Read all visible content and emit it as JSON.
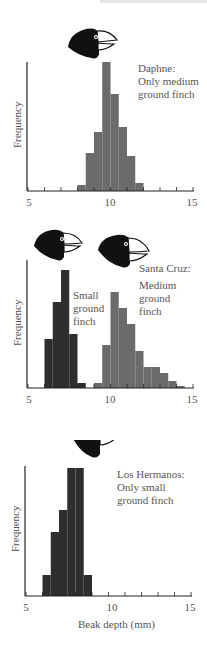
{
  "chart_data": [
    {
      "type": "bar",
      "title": "Daphne: Only medium ground finch",
      "xlabel": "",
      "ylabel": "Frequency",
      "xlim": [
        5,
        15
      ],
      "x_ticks": [
        5,
        10,
        15
      ],
      "bin_width": 0.5,
      "series": [
        {
          "name": "Medium ground finch",
          "color": "#6b6b6b",
          "bins": [
            8.0,
            8.5,
            9.0,
            9.5,
            10.0,
            10.5,
            11.0,
            11.5
          ],
          "values": [
            6,
            38,
            59,
            129,
            97,
            64,
            35,
            8
          ]
        }
      ]
    },
    {
      "type": "bar",
      "title": "Santa Cruz:",
      "xlabel": "",
      "ylabel": "Frequency",
      "xlim": [
        5,
        15
      ],
      "x_ticks": [
        5,
        10,
        15
      ],
      "bin_width": 0.5,
      "series": [
        {
          "name": "Small ground finch",
          "color": "#2e2e2e",
          "bins": [
            6.0,
            6.5,
            7.0,
            7.5,
            8.0
          ],
          "values": [
            49,
            86,
            118,
            54,
            5
          ]
        },
        {
          "name": "Medium ground finch",
          "color": "#6b6b6b",
          "bins": [
            9.0,
            9.5,
            10.0,
            10.5,
            11.0,
            11.5,
            12.0,
            12.5,
            13.0,
            13.5,
            14.0
          ],
          "values": [
            5,
            43,
            96,
            80,
            64,
            37,
            21,
            21,
            15,
            7,
            2
          ]
        }
      ]
    },
    {
      "type": "bar",
      "title": "Los Hermanos: Only small ground finch",
      "xlabel": "Beak depth (mm)",
      "ylabel": "Frequency",
      "xlim": [
        5,
        15
      ],
      "x_ticks": [
        5,
        10,
        15
      ],
      "bin_width": 0.5,
      "series": [
        {
          "name": "Small ground finch",
          "color": "#2e2e2e",
          "bins": [
            6.0,
            6.5,
            7.0,
            7.5,
            8.0,
            8.5
          ],
          "values": [
            21,
            64,
            86,
            128,
            128,
            21
          ]
        }
      ]
    }
  ],
  "panels": [
    {
      "label_lines": [
        "Daphne:",
        "Only medium",
        "ground finch"
      ],
      "ylabel": "Frequency",
      "ticks": [
        "5",
        "10",
        "15"
      ]
    },
    {
      "label_lines": [
        "Santa Cruz:"
      ],
      "small_label_lines": [
        "Small",
        "ground",
        "finch"
      ],
      "medium_label_lines": [
        "Medium",
        "ground",
        "finch"
      ],
      "ylabel": "Frequency",
      "ticks": [
        "5",
        "10",
        "15"
      ]
    },
    {
      "label_lines": [
        "Los Hermanos:",
        "Only small",
        "ground finch"
      ],
      "ylabel": "Frequency",
      "ticks": [
        "5",
        "10",
        "15"
      ],
      "xtitle": "Beak depth (mm)"
    }
  ]
}
